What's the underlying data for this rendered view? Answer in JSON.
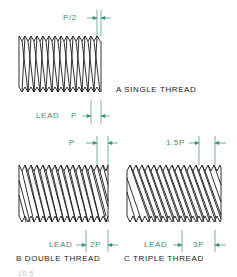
{
  "colors": {
    "outline": "#1a1a1a",
    "dimension": "#3a8f7a",
    "caption": "#222222",
    "background": "#ffffff"
  },
  "figures": [
    {
      "id": "A",
      "caption": "A  SINGLE THREAD",
      "top_dimension": "P/2",
      "bottom_lead_label": "LEAD",
      "bottom_dimension": "P"
    },
    {
      "id": "B",
      "caption": "B  DOUBLE THREAD",
      "top_dimension": "P",
      "bottom_lead_label": "LEAD",
      "bottom_dimension": "2P"
    },
    {
      "id": "C",
      "caption": "C  TRIPLE THREAD",
      "top_dimension": "1.5P",
      "bottom_lead_label": "LEAD",
      "bottom_dimension": "3P"
    }
  ],
  "footer_partial": "10.5"
}
